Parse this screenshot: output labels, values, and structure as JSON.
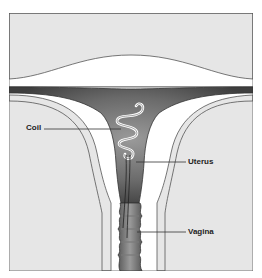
{
  "diagram": {
    "type": "anatomical-illustration",
    "labels": [
      {
        "id": "coil",
        "text": "Coil"
      },
      {
        "id": "uterus",
        "text": "Uterus"
      },
      {
        "id": "vagina",
        "text": "Vagina"
      }
    ],
    "colors": {
      "background": "#e6e6e6",
      "frame": "#555555",
      "tissue_white": "#ffffff",
      "organ_dark": "#4a4a4a",
      "organ_mid": "#8a8a8a",
      "coil": "#ffffff"
    }
  }
}
